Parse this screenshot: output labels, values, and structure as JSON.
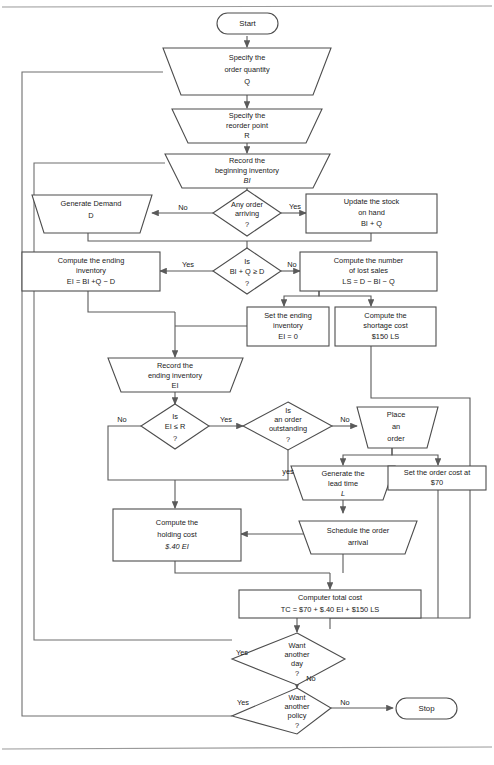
{
  "diagram": {
    "colors": {
      "shape_stroke": "#4d4d4d",
      "connector": "#5a5a5a",
      "loopback": "#6e6e6e",
      "text": "#1a1a1a",
      "background": "#ffffff"
    },
    "nodes": {
      "start": {
        "shape": "terminator",
        "lines": [
          "Start"
        ]
      },
      "specify_q": {
        "shape": "trapezoid-input",
        "lines": [
          "Specify the",
          "order quantity",
          "Q"
        ]
      },
      "specify_r": {
        "shape": "trapezoid-input",
        "lines": [
          "Specify the",
          "reorder point",
          "R"
        ]
      },
      "record_bi": {
        "shape": "trapezoid-input",
        "lines": [
          "Record the",
          "beginning inventory",
          "BI"
        ],
        "italic_lines": [
          2
        ]
      },
      "any_order": {
        "shape": "decision",
        "lines": [
          "Any order",
          "arriving",
          "?"
        ]
      },
      "gen_demand": {
        "shape": "trapezoid-input",
        "lines": [
          "Generate Demand",
          "D"
        ]
      },
      "update_stock": {
        "shape": "rect",
        "lines": [
          "Update the stock",
          "on hand",
          "BI + Q"
        ]
      },
      "bi_q_ge_d": {
        "shape": "decision",
        "lines": [
          "Is",
          "BI + Q ≥ D",
          "?"
        ]
      },
      "compute_ei": {
        "shape": "rect",
        "lines": [
          "Compute the ending",
          "inventory",
          "EI = BI +Q  − D"
        ]
      },
      "lost_sales": {
        "shape": "rect",
        "lines": [
          "Compute the number",
          "of lost sales",
          "LS  = D − BI − Q"
        ]
      },
      "set_ei_zero": {
        "shape": "rect",
        "lines": [
          "Set the ending",
          "inventory",
          "EI = 0"
        ]
      },
      "shortage": {
        "shape": "rect",
        "lines": [
          "Compute the",
          "shortage cost",
          "$150   LS"
        ]
      },
      "record_ei": {
        "shape": "trapezoid-input",
        "lines": [
          "Record the",
          "ending inventory",
          "EI"
        ]
      },
      "ei_le_r": {
        "shape": "decision",
        "lines": [
          "Is",
          "EI ≤  R",
          "?"
        ]
      },
      "outstanding": {
        "shape": "decision",
        "lines": [
          "Is",
          "an order",
          "outstanding",
          "?"
        ]
      },
      "place_order": {
        "shape": "trapezoid-input",
        "lines": [
          "Place",
          "an",
          "order"
        ]
      },
      "lead_time": {
        "shape": "trapezoid-input",
        "lines": [
          "Generate the",
          "lead time",
          "L"
        ],
        "italic_lines": [
          2
        ]
      },
      "order_cost": {
        "shape": "rect",
        "lines": [
          "Set the order cost at",
          "$70"
        ]
      },
      "schedule": {
        "shape": "trapezoid-output",
        "lines": [
          "Schedule the order",
          "arrival"
        ]
      },
      "holding": {
        "shape": "rect",
        "lines": [
          "Compute the",
          "holding cost",
          "$.40 EI"
        ],
        "italic_lines": [
          2
        ]
      },
      "total_cost": {
        "shape": "rect",
        "lines": [
          "Computer total cost",
          "TC = $70 +  $.40 EI +  $150 LS"
        ]
      },
      "another_day": {
        "shape": "decision",
        "lines": [
          "Want",
          "another",
          "day",
          "?"
        ]
      },
      "another_pol": {
        "shape": "decision",
        "lines": [
          "Want",
          "another",
          "policy",
          "?"
        ]
      },
      "stop": {
        "shape": "terminator",
        "lines": [
          "Stop"
        ]
      }
    },
    "edge_labels": {
      "any_order_no": "No",
      "any_order_yes": "Yes",
      "bi_q_yes": "Yes",
      "bi_q_no": "No",
      "ei_le_r_no": "No",
      "ei_le_r_yes": "Yes",
      "outstanding_no": "No",
      "outstanding_yes": "yes",
      "another_day_yes": "Yes",
      "another_day_no": "No",
      "another_pol_yes": "Yes",
      "another_pol_no": "No"
    }
  }
}
